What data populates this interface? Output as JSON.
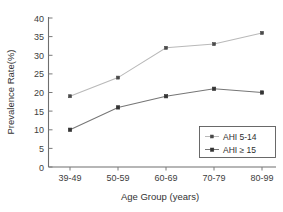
{
  "chart_data": {
    "type": "line",
    "title": "",
    "xlabel": "Age Group (years)",
    "ylabel": "Prevalence Rate(%)",
    "categories": [
      "39-49",
      "50-59",
      "60-69",
      "70-79",
      "80-99"
    ],
    "series": [
      {
        "name": "AHI 5-14",
        "values": [
          19,
          24,
          32,
          33,
          36
        ],
        "color": "#b9b9b9",
        "marker_color": "#4a4a4a"
      },
      {
        "name": "AHI ≥ 15",
        "values": [
          10,
          16,
          19,
          21,
          20
        ],
        "color": "#767676",
        "marker_color": "#343434"
      }
    ],
    "ylim": [
      0,
      40
    ],
    "ytick_values": [
      0,
      5,
      10,
      15,
      20,
      25,
      30,
      35,
      40
    ],
    "ytick_labels": [
      "0",
      "5",
      "10",
      "15",
      "20",
      "25",
      "30",
      "35",
      "40"
    ],
    "grid": false,
    "legend_position": "lower-right",
    "legend_entries": [
      "AHI 5-14",
      "AHI ≥ 15"
    ]
  },
  "axes": {
    "y_title": "Prevalence Rate(%)",
    "x_title": "Age Group (years)",
    "y_ticks": [
      "0",
      "5",
      "10",
      "15",
      "20",
      "25",
      "30",
      "35",
      "40"
    ],
    "x_ticks": [
      "39-49",
      "50-59",
      "60-69",
      "70-79",
      "80-99"
    ]
  },
  "legend": {
    "items": [
      {
        "label": "AHI 5-14"
      },
      {
        "label": "AHI ≥ 15"
      }
    ]
  }
}
